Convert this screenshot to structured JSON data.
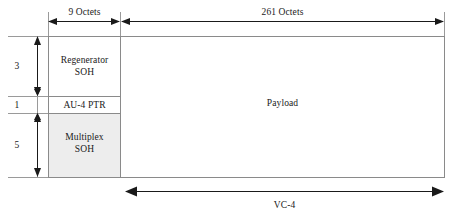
{
  "diagram": {
    "width": 463,
    "height": 221,
    "colors": {
      "line": "#1a1a1a",
      "guide": "#9a9a9a",
      "box_border": "#8a8a8a",
      "shaded_fill": "#ededed",
      "background": "#ffffff"
    }
  },
  "blocks": {
    "regenerator_soh": "Regenerator\nSOH",
    "au4_ptr": "AU-4 PTR",
    "multiplex_soh": "Multiplex\nSOH",
    "payload": "Payload"
  },
  "dimensions": {
    "top_left": "9 Octets",
    "top_right": "261 Octets",
    "rows_regenerator": "3",
    "rows_pointer": "1",
    "rows_multiplex": "5",
    "bottom": "VC-4"
  }
}
